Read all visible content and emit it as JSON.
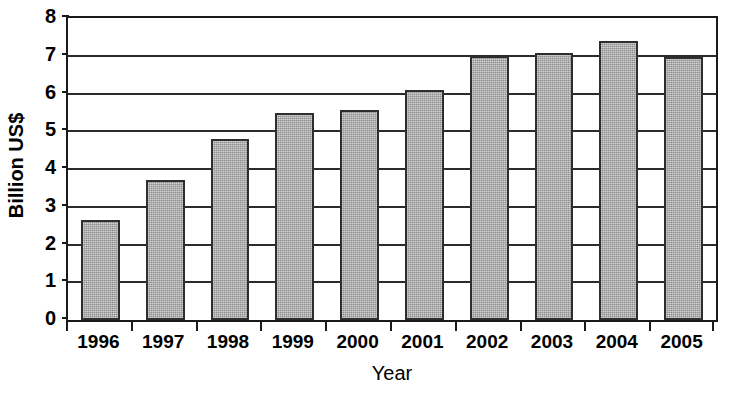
{
  "chart_data": {
    "type": "bar",
    "title": "",
    "xlabel": "Year",
    "ylabel": "Billion US$",
    "categories": [
      "1996",
      "1997",
      "1998",
      "1999",
      "2000",
      "2001",
      "2002",
      "2003",
      "2004",
      "2005"
    ],
    "values": [
      2.65,
      3.7,
      4.8,
      5.48,
      5.57,
      6.1,
      7.0,
      7.08,
      7.38,
      6.97
    ],
    "ylim": [
      0,
      8
    ],
    "ytick_labels": [
      "0",
      "1",
      "2",
      "3",
      "4",
      "5",
      "6",
      "7",
      "8"
    ],
    "ytick_values": [
      0,
      1,
      2,
      3,
      4,
      5,
      6,
      7,
      8
    ],
    "grid": true,
    "grid_axis": "y",
    "legend": false,
    "legend_position": "none",
    "bar_color": "#8d8d8d",
    "bar_edge_color": "#2e2e2e",
    "axis_color": "#1a1a1a",
    "background_color": "#ffffff"
  }
}
